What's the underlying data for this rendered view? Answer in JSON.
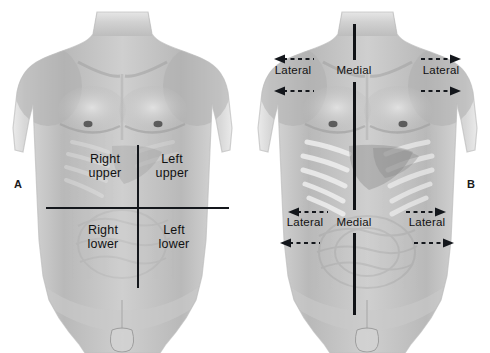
{
  "figure": {
    "background_color": "#ffffff",
    "line_color": "#14171c",
    "text_color": "#111111"
  },
  "panels": [
    {
      "letter": "A",
      "caption": "Four abdominal quadrants",
      "quadrants": [
        {
          "name": "right-upper-quadrant",
          "line1": "Right",
          "line2": "upper"
        },
        {
          "name": "left-upper-quadrant",
          "line1": "Left",
          "line2": "upper"
        },
        {
          "name": "right-lower-quadrant",
          "line1": "Right",
          "line2": "lower"
        },
        {
          "name": "left-lower-quadrant",
          "line1": "Left",
          "line2": "lower"
        }
      ]
    },
    {
      "letter": "B",
      "caption": "Medial and lateral directional terms",
      "directions": {
        "upper_left_lateral": "Lateral",
        "upper_medial": "Medial",
        "upper_right_lateral": "Lateral",
        "lower_left_lateral": "Lateral",
        "lower_medial": "Medial",
        "lower_right_lateral": "Lateral"
      },
      "arrows": [
        {
          "name": "arrow-upper-left-outer",
          "direction": "left"
        },
        {
          "name": "arrow-upper-left-inner",
          "direction": "left"
        },
        {
          "name": "arrow-upper-right-outer",
          "direction": "right"
        },
        {
          "name": "arrow-upper-right-inner",
          "direction": "right"
        },
        {
          "name": "arrow-lower-left-outer",
          "direction": "left"
        },
        {
          "name": "arrow-lower-left-inner",
          "direction": "left"
        },
        {
          "name": "arrow-lower-right-outer",
          "direction": "right"
        },
        {
          "name": "arrow-lower-right-inner",
          "direction": "right"
        }
      ]
    }
  ]
}
